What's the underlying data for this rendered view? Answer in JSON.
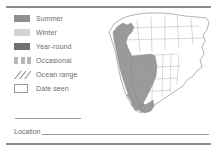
{
  "panel": {
    "type": "field-guide-range-map-card",
    "background_color": "#ffffff",
    "rule_color": "#8c8c8c"
  },
  "legend": {
    "items": [
      {
        "label": "Summer",
        "swatch": "solid-swatch",
        "color": "#8f8f8f"
      },
      {
        "label": "Winter",
        "swatch": "solid-swatch",
        "color": "#d3d3d3"
      },
      {
        "label": "Year-round",
        "swatch": "solid-swatch",
        "color": "#707070"
      },
      {
        "label": "Occasional",
        "swatch": "dashed-swatch",
        "color": "#b7b7b7"
      },
      {
        "label": "Ocean range",
        "swatch": "hatch-swatch",
        "color": "#8f8f8f"
      },
      {
        "label": "Date seen",
        "swatch": "outline-box-swatch",
        "color": "#9a9a9a"
      }
    ]
  },
  "fields": {
    "date_line_value": "",
    "location_label": "Location",
    "location_value": ""
  },
  "map": {
    "title": "North America range map",
    "region": "North America",
    "range_fill_color": "#9a9a9a",
    "border_color": "#7d7d7d",
    "state_line_color": "#9e9e9e",
    "range_description": "Shaded range along the Pacific coast and western United States, from southern Alaska south through British Columbia, Washington, Oregon, Idaho, Montana, Nevada, Utah, California, Arizona and into northwestern Mexico."
  }
}
